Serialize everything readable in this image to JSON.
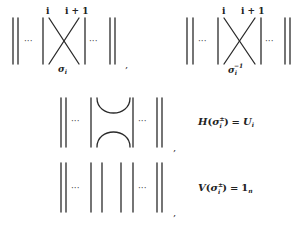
{
  "diagrams": {
    "sigma": {
      "label_left": "i",
      "label_right": "i + 1",
      "generator_symbol": "σ",
      "generator_subscript": "i",
      "ellipsis": "···",
      "separator": ","
    },
    "sigma_inverse": {
      "label_left": "i",
      "label_right": "i + 1",
      "generator_symbol": "σ",
      "generator_subscript": "i",
      "generator_superscript": "−1",
      "ellipsis": "···"
    },
    "horizontal": {
      "ellipsis": "···",
      "separator": ",",
      "formula": {
        "func": "H",
        "symbol": "σ",
        "superscript": "±",
        "subscript": "i",
        "equals": "=",
        "rhs": "U",
        "rhs_subscript": "i"
      }
    },
    "vertical": {
      "ellipsis": "···",
      "separator": ",",
      "formula": {
        "func": "V",
        "symbol": "σ",
        "superscript": "±",
        "subscript": "i",
        "equals": "=",
        "rhs": "1",
        "rhs_subscript": "n"
      }
    }
  }
}
